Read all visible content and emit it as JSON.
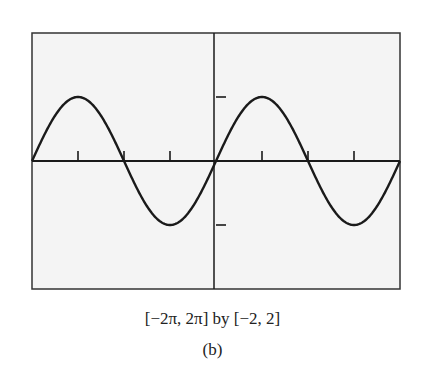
{
  "chart_data": {
    "type": "line",
    "title": "",
    "function": "y = sin(x)",
    "xlabel": "",
    "ylabel": "",
    "xlim": [
      -6.2832,
      6.2832
    ],
    "ylim": [
      -2,
      2
    ],
    "x_tick_values": [
      -4.7124,
      -3.1416,
      -1.5708,
      1.5708,
      3.1416,
      4.7124
    ],
    "x_tick_labels": [
      "",
      "",
      "",
      "",
      "",
      ""
    ],
    "y_tick_values": [
      -1,
      1
    ],
    "y_tick_labels": [
      "",
      ""
    ],
    "grid": false,
    "legend": null,
    "series": [
      {
        "name": "sin(x)",
        "x": [
          -6.2832,
          -5.4978,
          -4.7124,
          -3.927,
          -3.1416,
          -2.3562,
          -1.5708,
          -0.7854,
          0,
          0.7854,
          1.5708,
          2.3562,
          3.1416,
          3.927,
          4.7124,
          5.4978,
          6.2832
        ],
        "values": [
          0,
          0.7071,
          1,
          0.7071,
          0,
          -0.7071,
          -1,
          -0.7071,
          0,
          0.7071,
          1,
          0.7071,
          0,
          -0.7071,
          -1,
          -0.7071,
          0
        ]
      }
    ],
    "window_caption": "[−2π, 2π] by [−2, 2]",
    "panel_label": "(b)"
  },
  "caption": {
    "window": "[−2π, 2π] by [−2, 2]",
    "panel": "(b)"
  },
  "colors": {
    "background": "#f4f4f4",
    "frame": "#333333",
    "curve": "#1a1a1a",
    "axis": "#1a1a1a"
  }
}
